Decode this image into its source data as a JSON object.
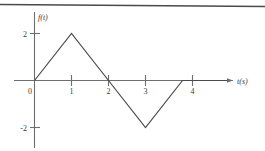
{
  "figure": {
    "name": "triangular-waveform-figure",
    "background_color": "#ffffff",
    "line_color": "#4a4a4a",
    "axis_color": "#6e6e6e",
    "text_color": "#3a3a3a",
    "top_rule": true
  },
  "chart_data": {
    "type": "line",
    "title": "",
    "subtitle": "",
    "xlabel": "t(s)",
    "ylabel": "f(t)",
    "x": [
      0,
      1,
      2,
      3,
      4,
      5.2
    ],
    "y": [
      0,
      2,
      0,
      -2,
      0,
      0
    ],
    "series": [
      {
        "name": "f(t)",
        "x": [
          0,
          1,
          2,
          3,
          4,
          5.2
        ],
        "values": [
          0,
          2,
          0,
          -2,
          0,
          0
        ]
      }
    ],
    "xlim": [
      -0.35,
      5.7
    ],
    "ylim": [
      -2.9,
      2.85
    ],
    "xticks": [
      1,
      2,
      3,
      4
    ],
    "xtick_labels": [
      "1",
      "2",
      "3",
      "4"
    ],
    "yticks": [
      2,
      -2
    ],
    "ytick_labels": [
      "2",
      "-2"
    ],
    "origin_label": "0",
    "grid": false,
    "legend": false,
    "legend_position": "none",
    "x_axis_arrow": true,
    "annotations": []
  },
  "labels": {
    "y_axis": "f(t)",
    "x_axis": "t(s)",
    "origin": "0",
    "y_tick_pos": "2",
    "y_tick_neg": "-2",
    "x_tick_1": "1",
    "x_tick_2": "2",
    "x_tick_3": "3",
    "x_tick_4": "4"
  }
}
